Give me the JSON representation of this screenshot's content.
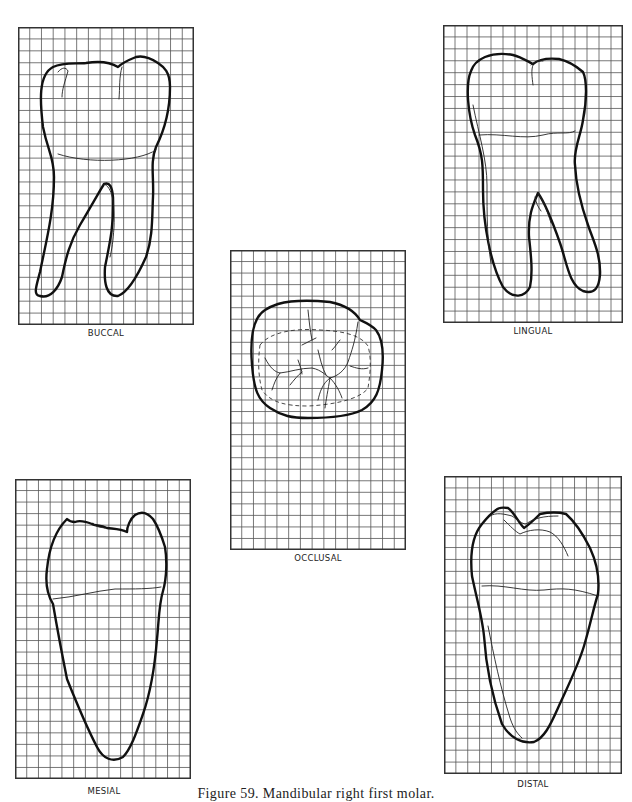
{
  "figure": {
    "caption": "Figure 59. Mandibular right first molar."
  },
  "grid": {
    "line_color": "#555555",
    "border_color": "#333333",
    "columns": 15,
    "rows": 25
  },
  "views": {
    "buccal": {
      "label": "BUCCAL"
    },
    "lingual": {
      "label": "LINGUAL"
    },
    "occlusal": {
      "label": "OCCLUSAL"
    },
    "mesial": {
      "label": "MESIAL"
    },
    "distal": {
      "label": "DISTAL"
    }
  }
}
